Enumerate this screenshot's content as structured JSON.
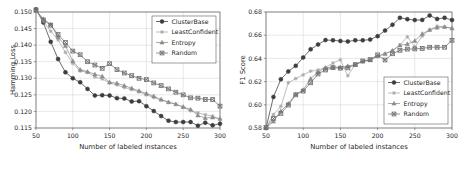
{
  "figure": {
    "background_color": "#ffffff",
    "panel_count": 2
  },
  "chart_data": [
    {
      "type": "line",
      "title": "",
      "xlabel": "Number of labeled instances",
      "ylabel": "Hamming Loss",
      "xlim": [
        50,
        300
      ],
      "ylim": [
        0.115,
        0.15
      ],
      "xticks": [
        50,
        100,
        150,
        200,
        250,
        300
      ],
      "yticks": [
        0.115,
        0.12,
        0.125,
        0.13,
        0.135,
        0.14,
        0.145,
        0.15
      ],
      "ytick_labels": [
        "0.115",
        "0.120",
        "0.125",
        "0.130",
        "0.135",
        "0.140",
        "0.145",
        "0.150"
      ],
      "xtick_labels": [
        "50",
        "100",
        "150",
        "200",
        "250",
        "300"
      ],
      "grid": true,
      "legend_position": "upper right",
      "x": [
        50,
        60,
        70,
        80,
        90,
        100,
        110,
        120,
        130,
        140,
        150,
        160,
        170,
        180,
        190,
        200,
        210,
        220,
        230,
        240,
        250,
        260,
        270,
        280,
        290,
        300
      ],
      "series": [
        {
          "name": "ClusterBase",
          "marker": "circle",
          "color": "#3d3d3d",
          "values": [
            0.1508,
            0.1468,
            0.141,
            0.1358,
            0.1318,
            0.13,
            0.1288,
            0.1268,
            0.1248,
            0.1249,
            0.1248,
            0.124,
            0.1239,
            0.123,
            0.1231,
            0.1216,
            0.1201,
            0.1186,
            0.1172,
            0.1168,
            0.1168,
            0.1168,
            0.1157,
            0.1166,
            0.1158,
            0.1163
          ]
        },
        {
          "name": "LeastConfident",
          "marker": "plus",
          "color": "#a8a8a8",
          "values": [
            0.1505,
            0.1472,
            0.1442,
            0.1416,
            0.1378,
            0.1345,
            0.1322,
            0.1318,
            0.1304,
            0.1298,
            0.1286,
            0.128,
            0.1272,
            0.1266,
            0.1259,
            0.125,
            0.1242,
            0.1234,
            0.1228,
            0.1222,
            0.1212,
            0.1202,
            0.1196,
            0.119,
            0.1186,
            0.1176
          ]
        },
        {
          "name": "Entropy",
          "marker": "triangle",
          "color": "#8c8c8c",
          "values": [
            0.1504,
            0.1479,
            0.1463,
            0.1424,
            0.1398,
            0.1352,
            0.1326,
            0.132,
            0.1312,
            0.1306,
            0.1288,
            0.1285,
            0.1278,
            0.127,
            0.1262,
            0.1254,
            0.1246,
            0.1236,
            0.1228,
            0.1222,
            0.1214,
            0.1206,
            0.1188,
            0.118,
            0.1182,
            0.1178
          ]
        },
        {
          "name": "Random",
          "marker": "square-x",
          "color": "#707070",
          "values": [
            0.1506,
            0.1476,
            0.146,
            0.1432,
            0.1408,
            0.1382,
            0.1371,
            0.135,
            0.134,
            0.133,
            0.1344,
            0.1326,
            0.1316,
            0.1308,
            0.13,
            0.1296,
            0.1286,
            0.1278,
            0.1268,
            0.1258,
            0.125,
            0.1241,
            0.124,
            0.1236,
            0.1236,
            0.1216
          ]
        }
      ]
    },
    {
      "type": "line",
      "title": "",
      "xlabel": "Number of labeled instances",
      "ylabel": "F1 Score",
      "xlim": [
        50,
        300
      ],
      "ylim": [
        0.58,
        0.68
      ],
      "xticks": [
        50,
        100,
        150,
        200,
        250,
        300
      ],
      "yticks": [
        0.58,
        0.6,
        0.62,
        0.64,
        0.66,
        0.68
      ],
      "ytick_labels": [
        "0.58",
        "0.60",
        "0.62",
        "0.64",
        "0.66",
        "0.68"
      ],
      "xtick_labels": [
        "50",
        "100",
        "150",
        "200",
        "250",
        "300"
      ],
      "grid": true,
      "legend_position": "lower right",
      "x": [
        50,
        60,
        70,
        80,
        90,
        100,
        110,
        120,
        130,
        140,
        150,
        160,
        170,
        180,
        190,
        200,
        210,
        220,
        230,
        240,
        250,
        260,
        270,
        280,
        290,
        300
      ],
      "series": [
        {
          "name": "ClusterBase",
          "marker": "circle",
          "color": "#3d3d3d",
          "values": [
            0.58,
            0.6068,
            0.622,
            0.6288,
            0.6336,
            0.6408,
            0.6478,
            0.652,
            0.6558,
            0.6556,
            0.655,
            0.6546,
            0.6556,
            0.6556,
            0.6562,
            0.6592,
            0.664,
            0.669,
            0.675,
            0.6738,
            0.673,
            0.6732,
            0.677,
            0.674,
            0.675,
            0.673
          ]
        },
        {
          "name": "LeastConfident",
          "marker": "plus",
          "color": "#a8a8a8",
          "values": [
            0.5806,
            0.5916,
            0.5986,
            0.619,
            0.6226,
            0.6258,
            0.629,
            0.63,
            0.6322,
            0.636,
            0.6388,
            0.625,
            0.635,
            0.6372,
            0.6386,
            0.642,
            0.6442,
            0.6468,
            0.6516,
            0.6586,
            0.65,
            0.6592,
            0.6646,
            0.6678,
            0.6672,
            0.666
          ]
        },
        {
          "name": "Entropy",
          "marker": "triangle",
          "color": "#8c8c8c",
          "values": [
            0.5802,
            0.5856,
            0.5946,
            0.601,
            0.6092,
            0.6128,
            0.6226,
            0.6282,
            0.6318,
            0.6326,
            0.6322,
            0.6334,
            0.6346,
            0.6374,
            0.6384,
            0.642,
            0.6438,
            0.6466,
            0.6512,
            0.6524,
            0.6552,
            0.6612,
            0.6646,
            0.6666,
            0.6672,
            0.6658
          ]
        },
        {
          "name": "Random",
          "marker": "square-x",
          "color": "#707070",
          "values": [
            0.5804,
            0.5882,
            0.5926,
            0.5998,
            0.6086,
            0.6118,
            0.619,
            0.6266,
            0.63,
            0.632,
            0.6316,
            0.6318,
            0.6346,
            0.6378,
            0.639,
            0.643,
            0.6386,
            0.644,
            0.647,
            0.648,
            0.6482,
            0.6486,
            0.6496,
            0.6496,
            0.6496,
            0.6556
          ]
        }
      ]
    }
  ]
}
